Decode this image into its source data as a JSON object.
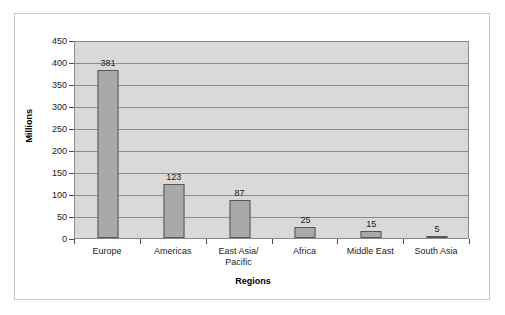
{
  "chart_data": {
    "type": "bar",
    "title": "",
    "xlabel": "Regions",
    "ylabel": "Millions",
    "categories": [
      "Europe",
      "Americas",
      "East Asia/\nPacific",
      "Africa",
      "Middle East",
      "South Asia"
    ],
    "values": [
      381,
      123,
      87,
      25,
      15,
      5
    ],
    "value_labels": [
      "381",
      "123",
      "87",
      "25",
      "15",
      "5"
    ],
    "ylim": [
      0,
      450
    ],
    "ytick_labels": [
      "450",
      "400",
      "350",
      "300",
      "250",
      "200",
      "150",
      "100",
      "50",
      "0"
    ],
    "ytick_values": [
      450,
      400,
      350,
      300,
      250,
      200,
      150,
      100,
      50,
      0
    ],
    "grid": true,
    "legend": "none",
    "colors": {
      "bar_fill": "#a9a9a9",
      "bar_border": "#575757",
      "plot_background": "#d9d9d9",
      "gridline": "#8d8d8d",
      "plot_border": "#8a8a8a",
      "frame_border": "#c9c9c9",
      "page_background": "#ffffff",
      "text": "#1a1a1a"
    }
  }
}
